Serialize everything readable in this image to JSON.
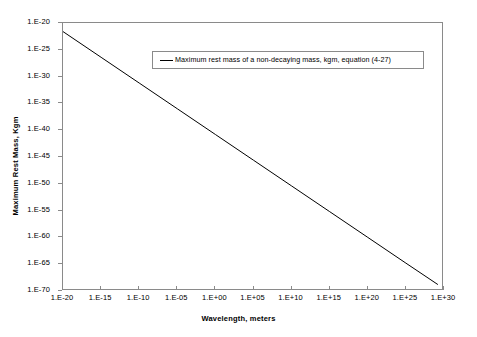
{
  "chart_data": {
    "type": "line",
    "title": "",
    "xlabel": "Wavelength, meters",
    "ylabel": "Maximum Rest Mass, Kgm",
    "xscale": "log",
    "yscale": "log",
    "grid": false,
    "legend_position": "top-center-inside",
    "xlim": [
      1e-20,
      1e+30
    ],
    "ylim": [
      1e-70,
      1e-20
    ],
    "xticks": [
      "1.E-20",
      "1.E-15",
      "1.E-10",
      "1.E-05",
      "1.E+00",
      "1.E+05",
      "1.E+10",
      "1.E+15",
      "1.E+20",
      "1.E+25",
      "1.E+30"
    ],
    "xtick_exponents": [
      -20,
      -15,
      -10,
      -5,
      0,
      5,
      10,
      15,
      20,
      25,
      30
    ],
    "yticks": [
      "1.E-20",
      "1.E-25",
      "1.E-30",
      "1.E-35",
      "1.E-40",
      "1.E-45",
      "1.E-50",
      "1.E-55",
      "1.E-60",
      "1.E-65",
      "1.E-70"
    ],
    "ytick_exponents": [
      -20,
      -25,
      -30,
      -35,
      -40,
      -45,
      -50,
      -55,
      -60,
      -65,
      -70
    ],
    "series": [
      {
        "name": "Maximum rest mass of a non-decaying mass, kgm, equation (4-27)",
        "color": "#000000",
        "x_exponents": [
          -20,
          -15,
          -10,
          -5,
          0,
          5,
          10,
          15,
          20,
          25,
          29.2
        ],
        "y_exponents": [
          -21.6,
          -26.4,
          -31.2,
          -36.0,
          -40.8,
          -45.6,
          -50.4,
          -55.2,
          -60.0,
          -64.8,
          -68.8
        ]
      }
    ]
  },
  "legend": {
    "entries": [
      {
        "label": "Maximum rest mass of a non-decaying mass, kgm, equation (4-27)",
        "swatch": "line-swatch",
        "color": "#000000"
      }
    ]
  },
  "axes": {
    "x_title": "Wavelength, meters",
    "y_title": "Maximum Rest Mass, Kgm"
  },
  "colors": {
    "frame": "#8a8a8a",
    "series": "#000000",
    "background": "#ffffff"
  }
}
